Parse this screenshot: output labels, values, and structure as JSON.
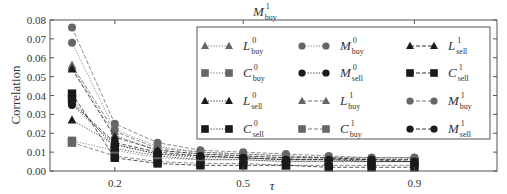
{
  "chart_data": {
    "type": "line",
    "xlabel": "τ",
    "ylabel": "Correlation",
    "xlim": [
      0.05,
      1.15
    ],
    "ylim": [
      0.0,
      0.08
    ],
    "x_ticks": [
      0.2,
      0.5,
      0.9
    ],
    "x_tick_labels": [
      "0.2",
      "0.5",
      "0.9"
    ],
    "y_ticks": [
      0.0,
      0.01,
      0.02,
      0.03,
      0.04,
      0.05,
      0.06,
      0.07,
      0.08
    ],
    "y_tick_labels": [
      "0.00",
      "0.01",
      "0.02",
      "0.03",
      "0.04",
      "0.05",
      "0.06",
      "0.07",
      "0.08"
    ],
    "grid": false,
    "legend_position": "upper right (inside, 3 columns x 4 rows)",
    "x": [
      0.1,
      0.2,
      0.3,
      0.4,
      0.5,
      0.6,
      0.7,
      0.8,
      0.9
    ],
    "series": [
      {
        "name": "L^0_buy",
        "base": "L",
        "sup": "0",
        "sub": "buy",
        "marker": "triangle",
        "color": "#666666",
        "dash": "dotted",
        "values": [
          0.055,
          0.019,
          0.011,
          0.009,
          0.008,
          0.007,
          0.007,
          0.006,
          0.006
        ]
      },
      {
        "name": "C^0_buy",
        "base": "C",
        "sup": "0",
        "sub": "buy",
        "marker": "square",
        "color": "#666666",
        "dash": "dotted",
        "values": [
          0.016,
          0.011,
          0.007,
          0.006,
          0.006,
          0.005,
          0.005,
          0.005,
          0.005
        ]
      },
      {
        "name": "L^0_sell",
        "base": "L",
        "sup": "0",
        "sub": "sell",
        "marker": "triangle",
        "color": "#1a1a1a",
        "dash": "dotted",
        "values": [
          0.027,
          0.014,
          0.009,
          0.008,
          0.007,
          0.006,
          0.006,
          0.005,
          0.005
        ]
      },
      {
        "name": "C^0_sell",
        "base": "C",
        "sup": "0",
        "sub": "sell",
        "marker": "square",
        "color": "#1a1a1a",
        "dash": "dotted",
        "values": [
          0.038,
          0.012,
          0.008,
          0.006,
          0.006,
          0.005,
          0.005,
          0.005,
          0.005
        ]
      },
      {
        "name": "M^0_buy",
        "base": "M",
        "sup": "0",
        "sub": "buy",
        "marker": "circle",
        "color": "#666666",
        "dash": "dotted",
        "values": [
          0.068,
          0.022,
          0.013,
          0.01,
          0.009,
          0.008,
          0.007,
          0.007,
          0.007
        ]
      },
      {
        "name": "M^0_sell",
        "base": "M",
        "sup": "0",
        "sub": "sell",
        "marker": "circle",
        "color": "#1a1a1a",
        "dash": "dotted",
        "values": [
          0.035,
          0.014,
          0.009,
          0.007,
          0.007,
          0.006,
          0.006,
          0.005,
          0.005
        ]
      },
      {
        "name": "L^1_buy",
        "base": "L",
        "sup": "1",
        "sub": "buy",
        "marker": "triangle",
        "color": "#666666",
        "dash": "dashed",
        "values": [
          0.056,
          0.021,
          0.012,
          0.01,
          0.009,
          0.008,
          0.007,
          0.007,
          0.007
        ]
      },
      {
        "name": "C^1_buy",
        "base": "C",
        "sup": "1",
        "sub": "buy",
        "marker": "square",
        "color": "#666666",
        "dash": "dashed",
        "values": [
          0.015,
          0.008,
          0.005,
          0.004,
          0.004,
          0.003,
          0.003,
          0.003,
          0.003
        ]
      },
      {
        "name": "L^1_sell",
        "base": "L",
        "sup": "1",
        "sub": "sell",
        "marker": "triangle",
        "color": "#1a1a1a",
        "dash": "dashed",
        "values": [
          0.054,
          0.018,
          0.011,
          0.009,
          0.008,
          0.007,
          0.007,
          0.006,
          0.006
        ]
      },
      {
        "name": "C^1_sell",
        "base": "C",
        "sup": "1",
        "sub": "sell",
        "marker": "square",
        "color": "#1a1a1a",
        "dash": "dashed",
        "values": [
          0.041,
          0.007,
          0.004,
          0.003,
          0.003,
          0.003,
          0.002,
          0.002,
          0.002
        ]
      },
      {
        "name": "M^1_buy",
        "base": "M",
        "sup": "1",
        "sub": "buy",
        "marker": "circle",
        "color": "#666666",
        "dash": "dashed",
        "values": [
          0.076,
          0.025,
          0.015,
          0.011,
          0.01,
          0.009,
          0.008,
          0.007,
          0.007
        ]
      },
      {
        "name": "M^1_sell",
        "base": "M",
        "sup": "1",
        "sub": "sell",
        "marker": "circle",
        "color": "#1a1a1a",
        "dash": "dashed",
        "values": [
          0.036,
          0.015,
          0.01,
          0.008,
          0.007,
          0.006,
          0.006,
          0.006,
          0.005
        ]
      }
    ],
    "legend_order": [
      [
        "L^0_buy",
        "M^0_buy",
        "L^1_sell"
      ],
      [
        "C^0_buy",
        "M^0_sell",
        "C^1_sell"
      ],
      [
        "L^0_sell",
        "L^1_buy",
        "M^1_buy"
      ],
      [
        "C^0_sell",
        "C^1_buy",
        "M^1_sell"
      ]
    ]
  },
  "title": {
    "base": "M",
    "sup": "1",
    "sub": "buy"
  },
  "axes": {
    "xlabel": "τ",
    "ylabel": "Correlation"
  }
}
